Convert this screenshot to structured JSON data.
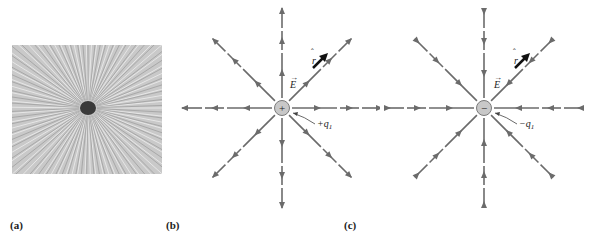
{
  "figure": {
    "panels": [
      {
        "id": "a",
        "label": "(a)",
        "description": "Photograph of grass seeds aligning radially around a charged object"
      },
      {
        "id": "b",
        "label": "(b)",
        "charge_symbol": "+",
        "charge_label": "+q",
        "charge_subscript": "1",
        "field_label": "E",
        "unit_vector_label": "r",
        "field_direction": "outward"
      },
      {
        "id": "c",
        "label": "(c)",
        "charge_symbol": "−",
        "charge_label": "−q",
        "charge_subscript": "1",
        "field_label": "E",
        "unit_vector_label": "r",
        "field_direction": "inward"
      }
    ],
    "colors": {
      "field_line": "#6b6b6b",
      "charge_fill": "#c8c8c8",
      "unit_vector": "#111111",
      "text": "#222222"
    }
  }
}
